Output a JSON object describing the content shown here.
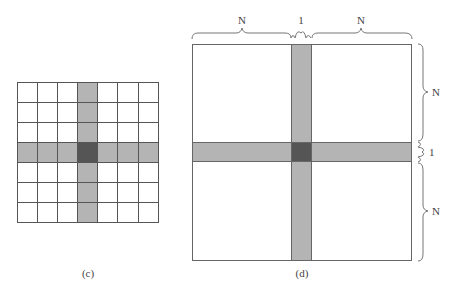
{
  "figure_c": {
    "label": "(c)",
    "grid_size": 7,
    "highlight_row": 3,
    "highlight_col": 3,
    "colors": {
      "cell": "#ffffff",
      "band": "#b4b4b4",
      "center": "#555555",
      "line": "#555555"
    }
  },
  "figure_d": {
    "label": "(d)",
    "top_braces": [
      "N",
      "1",
      "N"
    ],
    "right_braces": [
      "N",
      "1",
      "N"
    ],
    "colors": {
      "band": "#b4b4b4",
      "center": "#555555",
      "line": "#666666"
    }
  }
}
